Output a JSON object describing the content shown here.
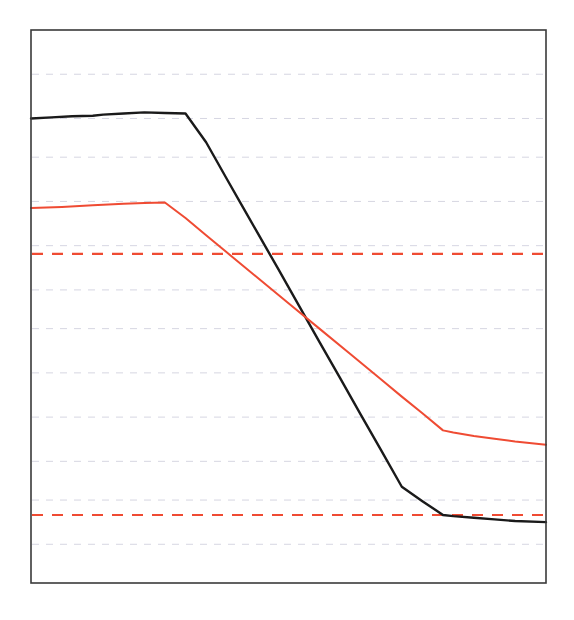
{
  "chart_data": {
    "type": "line",
    "title": "",
    "subtitle": "",
    "xlabel": "",
    "ylabel": "",
    "xlim": [
      0,
      100
    ],
    "ylim": [
      0,
      100
    ],
    "grid": true,
    "grid_orientation": "horizontal",
    "grid_style": "dashed",
    "grid_color": "#c8c8d8",
    "legend": "none",
    "x_tick_labels": [],
    "y_tick_labels": [],
    "y_gridline_values": [
      92,
      84,
      77,
      69,
      61,
      53,
      46,
      38,
      30,
      22,
      15,
      7
    ],
    "series": [
      {
        "name": "black-curve",
        "color": "#1a1a1a",
        "style": "solid",
        "width": 2.4,
        "x": [
          0,
          4,
          8,
          12,
          14,
          18,
          22,
          26,
          30,
          34,
          38,
          41,
          44,
          48,
          52,
          56,
          60,
          64,
          68,
          72,
          76,
          80,
          82,
          86,
          90,
          94,
          100
        ],
        "y": [
          84.0,
          84.2,
          84.4,
          84.5,
          84.7,
          84.9,
          85.1,
          85.0,
          84.9,
          79.7,
          73.1,
          68.2,
          63.3,
          56.8,
          50.2,
          43.6,
          37.1,
          30.5,
          24.0,
          17.4,
          14.8,
          12.3,
          12.1,
          11.8,
          11.5,
          11.2,
          11.0
        ]
      },
      {
        "name": "red-curve",
        "color": "#ef4b33",
        "style": "solid",
        "width": 2.0,
        "x": [
          0,
          6,
          12,
          16,
          18,
          22,
          26,
          30,
          34,
          38,
          44,
          50,
          56,
          62,
          68,
          72,
          76,
          80,
          82,
          86,
          90,
          94,
          100
        ],
        "y": [
          67.8,
          68.0,
          68.3,
          68.5,
          68.6,
          68.7,
          68.8,
          66.0,
          62.9,
          59.8,
          55.2,
          50.6,
          46.0,
          41.4,
          36.8,
          33.7,
          30.7,
          27.6,
          27.2,
          26.6,
          26.1,
          25.6,
          25.0
        ]
      }
    ],
    "hlines": [
      {
        "name": "upper-threshold",
        "value": 59.5,
        "color": "#ef4b33",
        "style": "dashed",
        "width": 2.2
      },
      {
        "name": "lower-threshold",
        "value": 12.3,
        "color": "#ef4b33",
        "style": "dashed",
        "width": 2.2
      }
    ],
    "annotations": [],
    "axes_frame": {
      "color": "#3a3a3a",
      "width": 1.6,
      "visible": true
    }
  },
  "figure": {
    "background": "#ffffff",
    "plot_background": "#ffffff",
    "plot_left": 31,
    "plot_top": 30,
    "plot_right": 546,
    "plot_bottom": 583
  }
}
